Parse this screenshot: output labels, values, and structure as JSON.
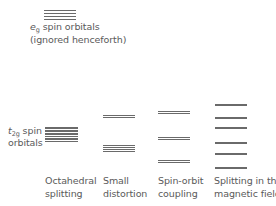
{
  "diagram": {
    "type": "energy-level-splitting",
    "eg": {
      "symbol": "e",
      "subscript": "g",
      "label_rest": " spin orbitals",
      "note": "(ignored henceforth)",
      "levels_y": [
        9.5,
        12.5,
        15.5,
        18.5
      ],
      "x": 44,
      "width": 32
    },
    "t2g": {
      "symbol": "t",
      "subscript": "2g",
      "label_rest": " spin",
      "label_line2": "orbitals",
      "levels_y": [
        127,
        130,
        133,
        135.5,
        138,
        140.5
      ],
      "x": 45,
      "width": 33
    },
    "columns": [
      {
        "id": "octahedral",
        "line1": "Octahedral",
        "line2": "splitting",
        "label_x": 45
      },
      {
        "id": "small-distortion",
        "line1": "Small",
        "line2": "distortion",
        "label_x": 103,
        "x": 103,
        "width": 32,
        "levels_y": [
          114.5,
          116.5,
          144.5,
          146.5,
          148.5,
          150.5
        ]
      },
      {
        "id": "spin-orbit",
        "line1": "Spin-orbit",
        "line2": "coupling",
        "label_x": 158,
        "x": 158,
        "width": 32,
        "levels_y": [
          110.5,
          112.5,
          136.5,
          138.5,
          159.5,
          161.5
        ]
      },
      {
        "id": "magnetic",
        "line1": "Splitting in the",
        "line2": "magnetic field",
        "label_x": 214,
        "x": 215,
        "width": 32,
        "levels_y": [
          104,
          117,
          127,
          142,
          153,
          167
        ]
      }
    ],
    "line_color": "#6a6a6a",
    "text_color": "#5a5a5a"
  }
}
